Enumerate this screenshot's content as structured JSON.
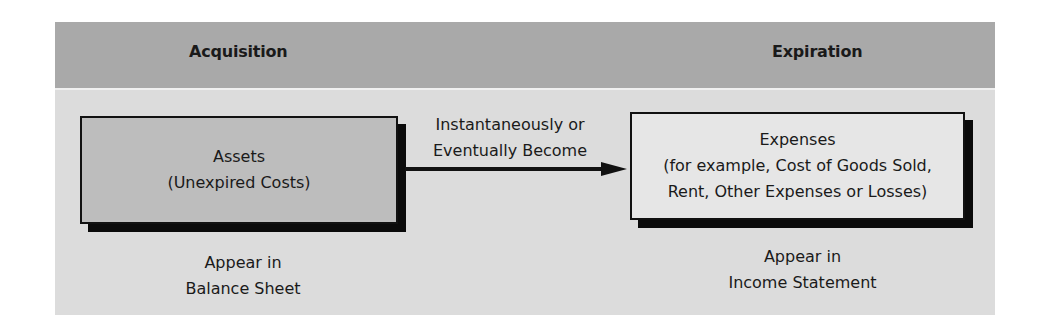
{
  "header": {
    "left_label": "Acquisition",
    "right_label": "Expiration"
  },
  "assets_box": {
    "line1": "Assets",
    "line2": "(Unexpired Costs)"
  },
  "assets_caption": {
    "line1": "Appear in",
    "line2": "Balance Sheet"
  },
  "arrow": {
    "line1": "Instantaneously or",
    "line2": "Eventually Become"
  },
  "expenses_box": {
    "line1": "Expenses",
    "line2": "(for example, Cost of Goods Sold,",
    "line3": "Rent, Other Expenses or Losses)"
  },
  "expenses_caption": {
    "line1": "Appear in",
    "line2": "Income Statement"
  },
  "colors": {
    "header_bg": "#a9a9a9",
    "body_bg": "#dcdcdc",
    "assets_box_bg": "#bdbdbd",
    "expenses_box_bg": "#e6e6e6",
    "shadow": "#0a0a0a"
  }
}
